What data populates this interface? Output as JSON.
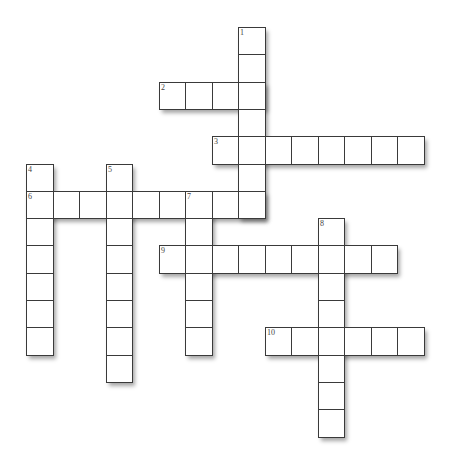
{
  "puzzle": {
    "title": "",
    "grid": {
      "origin_x": 26,
      "origin_y": 27,
      "cell_w": 26.5,
      "cell_h": 27.3
    },
    "colors": {
      "cell_fill": "#ffffff",
      "cell_border": "#3a3a3a",
      "number": "#444444",
      "background": "#ffffff"
    },
    "entries": [
      {
        "number": "1",
        "direction": "down",
        "row": 0,
        "col": 8,
        "length": 7
      },
      {
        "number": "2",
        "direction": "across",
        "row": 2,
        "col": 5,
        "length": 4
      },
      {
        "number": "3",
        "direction": "across",
        "row": 4,
        "col": 7,
        "length": 8
      },
      {
        "number": "4",
        "direction": "down",
        "row": 5,
        "col": 0,
        "length": 7
      },
      {
        "number": "5",
        "direction": "down",
        "row": 5,
        "col": 3,
        "length": 8
      },
      {
        "number": "6",
        "direction": "across",
        "row": 6,
        "col": 0,
        "length": 9
      },
      {
        "number": "7",
        "direction": "down",
        "row": 6,
        "col": 6,
        "length": 6
      },
      {
        "number": "8",
        "direction": "down",
        "row": 7,
        "col": 11,
        "length": 8
      },
      {
        "number": "9",
        "direction": "across",
        "row": 8,
        "col": 5,
        "length": 9
      },
      {
        "number": "10",
        "direction": "across",
        "row": 11,
        "col": 9,
        "length": 6
      }
    ]
  }
}
